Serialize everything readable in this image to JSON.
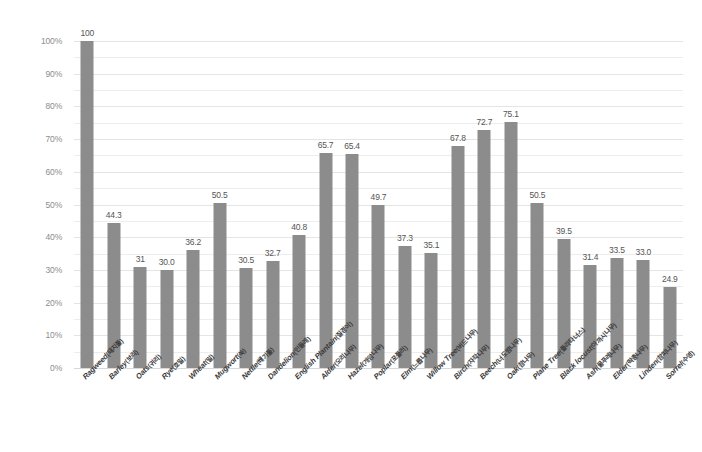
{
  "chart_data": {
    "type": "bar",
    "title": "",
    "xlabel": "",
    "ylabel": "",
    "ylim": [
      0,
      100
    ],
    "ytick_step": 10,
    "minor_gridline_step": 5,
    "grid": true,
    "legend": false,
    "bar_color": "#8c8c8c",
    "gridline_color": "#ededed",
    "value_label_color": "#555555",
    "axis_label_color": "#8d8d8d",
    "ytick_labels": [
      "0%",
      "10%",
      "20%",
      "30%",
      "40%",
      "50%",
      "60%",
      "70%",
      "80%",
      "90%",
      "100%"
    ],
    "ytick_values": [
      0,
      10,
      20,
      30,
      40,
      50,
      60,
      70,
      80,
      90,
      100
    ],
    "categories": [
      "Ragweed(돼지풀)",
      "Barley(보리)",
      "Oats(귀리)",
      "Rye(호밀)",
      "Wheat(밀)",
      "Mugwort(쑥)",
      "Nettle(쐐기풀)",
      "Dandelion(민들레)",
      "English Plantain(질경이)",
      "Alder(오리나무)",
      "Hazel(개암나무)",
      "Poplar(포플러)",
      "Elm(느릅나무)",
      "Willow Tree(버드나무)",
      "Birch(자작나무)",
      "Beech(너도밤나무)",
      "Oak(참나무)",
      "Plane Tree(플라타너스)",
      "Black locust(아까시나무)",
      "Ash(물푸레나무)",
      "Elder(딱총나무)",
      "Linden(참피나무)",
      "Sorrel(수영)"
    ],
    "categories_en": [
      "Ragweed",
      "Barley",
      "Oats",
      "Rye",
      "Wheat",
      "Mugwort",
      "Nettle",
      "Dandelion",
      "English Plantain",
      "Alder",
      "Hazel",
      "Poplar",
      "Elm",
      "Willow Tree",
      "Birch",
      "Beech",
      "Oak",
      "Plane Tree",
      "Black locust",
      "Ash",
      "Elder",
      "Linden",
      "Sorrel"
    ],
    "categories_kr": [
      "돼지풀",
      "보리",
      "귀리",
      "호밀",
      "밀",
      "쑥",
      "쐐기풀",
      "민들레",
      "질경이",
      "오리나무",
      "개암나무",
      "포플러",
      "느릅나무",
      "버드나무",
      "자작나무",
      "너도밤나무",
      "참나무",
      "플라타너스",
      "아까시나무",
      "물푸레나무",
      "딱총나무",
      "참피나무",
      "수영"
    ],
    "values": [
      100,
      44.3,
      31,
      30.0,
      36.2,
      50.5,
      30.5,
      32.7,
      40.8,
      65.7,
      65.4,
      49.7,
      37.3,
      35.1,
      67.8,
      72.7,
      75.1,
      50.5,
      39.5,
      31.4,
      33.5,
      33.0,
      24.9
    ],
    "value_labels": [
      "100",
      "44.3",
      "31",
      "30.0",
      "36.2",
      "50.5",
      "30.5",
      "32.7",
      "40.8",
      "65.7",
      "65.4",
      "49.7",
      "37.3",
      "35.1",
      "67.8",
      "72.7",
      "75.1",
      "50.5",
      "39.5",
      "31.4",
      "33.5",
      "33.0",
      "24.9"
    ]
  }
}
